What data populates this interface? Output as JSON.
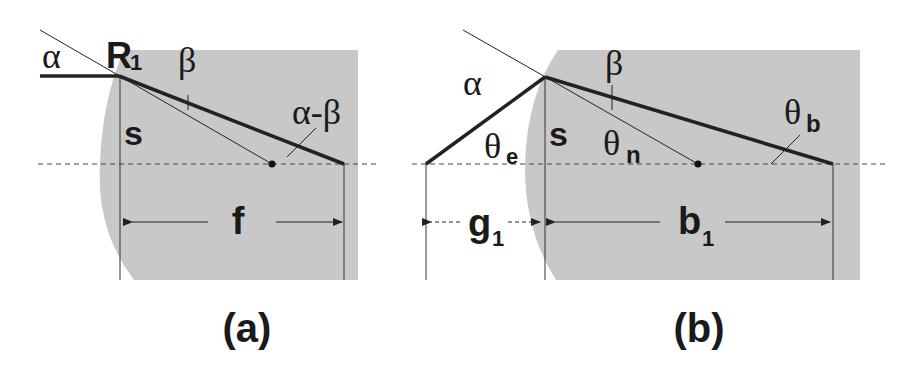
{
  "panels": [
    {
      "id": "a",
      "caption": "(a)",
      "labels": {
        "alpha": "α",
        "radius": "R",
        "radius_sub": "1",
        "beta": "β",
        "alpha_minus_beta": "α-β",
        "s": "s",
        "focal": "f"
      }
    },
    {
      "id": "b",
      "caption": "(b)",
      "labels": {
        "alpha": "α",
        "beta": "β",
        "theta_e": "θ",
        "theta_e_sub": "e",
        "theta_n": "θ",
        "theta_n_sub": "n",
        "theta_b": "θ",
        "theta_b_sub": "b",
        "s": "s",
        "g": "g",
        "g_sub": "1",
        "b": "b",
        "b_sub": "1"
      }
    }
  ],
  "colors": {
    "lens_fill": "#c8c8c8",
    "line": "#222222",
    "background": "#ffffff"
  }
}
